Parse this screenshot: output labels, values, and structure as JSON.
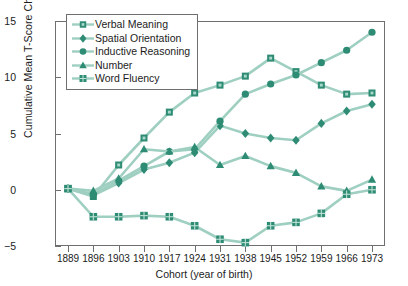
{
  "chart_data": {
    "type": "line",
    "title": "",
    "xlabel": "Cohort (year of birth)",
    "ylabel": "Cumulative Mean T-Score Change",
    "categories": [
      "1889",
      "1896",
      "1903",
      "1910",
      "1917",
      "1924",
      "1931",
      "1938",
      "1945",
      "1952",
      "1959",
      "1966",
      "1973"
    ],
    "ylim": [
      -5,
      15
    ],
    "yticks": [
      -5,
      0,
      5,
      10,
      15
    ],
    "grid": false,
    "legend_position": "top-left",
    "series": [
      {
        "name": "Verbal Meaning",
        "marker": "square",
        "color": "#2e8b74",
        "values": [
          0.1,
          -0.6,
          2.2,
          4.6,
          6.9,
          8.6,
          9.3,
          10.1,
          11.7,
          10.5,
          9.3,
          8.5,
          8.6
        ]
      },
      {
        "name": "Spatial Orientation",
        "marker": "diamond",
        "color": "#2e8b74",
        "values": [
          0.1,
          -0.5,
          0.6,
          1.8,
          2.4,
          3.3,
          5.7,
          5.0,
          4.6,
          4.4,
          5.9,
          7.0,
          7.6
        ]
      },
      {
        "name": "Inductive Reasoning",
        "marker": "circle",
        "color": "#2e8b74",
        "values": [
          0.1,
          -0.4,
          0.8,
          2.1,
          3.4,
          3.6,
          6.1,
          8.5,
          9.4,
          10.2,
          11.3,
          12.4,
          14.0
        ]
      },
      {
        "name": "Number",
        "marker": "triangle",
        "color": "#2e8b74",
        "values": [
          0.1,
          -0.1,
          1.0,
          3.6,
          3.4,
          3.8,
          2.2,
          3.0,
          2.1,
          1.5,
          0.3,
          -0.1,
          0.9
        ]
      },
      {
        "name": "Word Fluency",
        "marker": "gridsquare",
        "color": "#2e8b74",
        "values": [
          0.1,
          -2.4,
          -2.4,
          -2.3,
          -2.4,
          -3.2,
          -4.4,
          -4.7,
          -3.2,
          -2.9,
          -2.1,
          -0.4,
          0.0
        ]
      }
    ]
  },
  "axes": {
    "ytick_labels": [
      "15",
      "10",
      "5",
      "0",
      "-5"
    ],
    "xtick_labels": [
      "1889",
      "1896",
      "1903",
      "1910",
      "1917",
      "1924",
      "1931",
      "1938",
      "1945",
      "1952",
      "1959",
      "1966",
      "1973"
    ]
  },
  "legend": {
    "items": [
      {
        "label": "Verbal Meaning",
        "marker": "square-icon"
      },
      {
        "label": "Spatial Orientation",
        "marker": "diamond-icon"
      },
      {
        "label": "Inductive Reasoning",
        "marker": "circle-icon"
      },
      {
        "label": "Number",
        "marker": "triangle-icon"
      },
      {
        "label": "Word Fluency",
        "marker": "grid-square-icon"
      }
    ]
  },
  "style": {
    "line_color": "#9ecfc0",
    "marker_color": "#2e8b74",
    "axis_color": "#6f6f6f",
    "text_color": "#1c1c1c",
    "background": "#ffffff"
  }
}
